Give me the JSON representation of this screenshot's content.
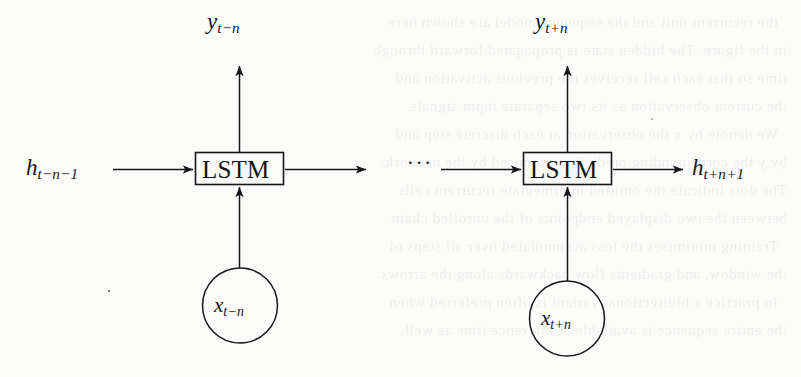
{
  "figure": {
    "type": "diagram",
    "background_color": "#fbfbfa",
    "ink_color": "#17171b",
    "cells": [
      {
        "id": "cell-left",
        "box_label": "LSTM",
        "input_label": {
          "base": "x",
          "sub_pre": "t",
          "sub_op": "−",
          "sub_post": "n",
          "full": "x_{t-n}"
        },
        "output_label": {
          "base": "y",
          "sub_pre": "t",
          "sub_op": "−",
          "sub_post": "n",
          "full": "y_{t-n}"
        },
        "state_in_label": {
          "base": "h",
          "sub": "t−n−1",
          "full": "h_{t-n-1}"
        }
      },
      {
        "id": "cell-right",
        "box_label": "LSTM",
        "input_label": {
          "base": "x",
          "sub_pre": "t",
          "sub_op": "+",
          "sub_post": "n",
          "full": "x_{t+n}"
        },
        "output_label": {
          "base": "y",
          "sub_pre": "t",
          "sub_op": "+",
          "sub_post": "n",
          "full": "y_{t+n}"
        },
        "state_out_label": {
          "base": "h",
          "sub": "t+n+1",
          "full": "h_{t+n+1}"
        }
      }
    ],
    "ellipsis": "···",
    "labels": {
      "y_left": "y",
      "y_left_sub": "t−n",
      "y_right": "y",
      "y_right_sub": "t+n",
      "h_left": "h",
      "h_left_sub": "t−n−1",
      "h_right": "h",
      "h_right_sub": "t+n+1",
      "x_left": "x",
      "x_left_sub": "t−n",
      "x_right": "x",
      "x_right_sub": "t+n",
      "lstm": "LSTM"
    }
  },
  "bleed_through": {
    "note": "faint mirrored text showing through from the reverse side of the scanned page",
    "lines": [
      "  the recurrent unit and the sequence model are shown here",
      "in the figure. The hidden state is propagated forward through",
      "time so that each cell receives the previous activation and",
      "the current observation as its two separate input signals.",
      "  We denote by x the observation at each discrete step and",
      "by y the corresponding prediction produced by the network.",
      "The dots indicate the omitted intermediate recurrent cells",
      "between the two displayed endpoints of the unrolled chain.",
      "  Training minimises the loss accumulated over all steps of",
      "the window, and gradients flow backwards along the arrows.",
      "  In practice a bidirectional variant is often preferred when",
      "the entire sequence is available at inference time as well."
    ]
  }
}
